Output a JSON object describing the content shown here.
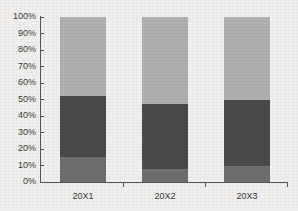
{
  "chart_data": {
    "type": "bar",
    "stacked": true,
    "title": "",
    "subtitle": "",
    "xlabel": "",
    "ylabel": "",
    "grid": false,
    "legend": "none",
    "categories": [
      "20X1",
      "20X2",
      "20X3"
    ],
    "ylim": [
      0,
      100
    ],
    "y_tick_labels": [
      "100%",
      "90%",
      "80%",
      "70%",
      "60%",
      "50%",
      "40%",
      "30%",
      "20%",
      "10%",
      "0%"
    ],
    "y_tick_values": [
      100,
      90,
      80,
      70,
      60,
      50,
      40,
      30,
      20,
      10,
      0
    ],
    "series": [
      {
        "name": "bottom-segment",
        "color": "#6e6e6e",
        "values": [
          15,
          8,
          10
        ]
      },
      {
        "name": "middle-segment",
        "color": "#4a4a4a",
        "values": [
          37,
          39,
          40
        ]
      },
      {
        "name": "top-segment",
        "color": "#b0b0b0",
        "values": [
          48,
          53,
          50
        ]
      }
    ],
    "cumulative_tops": [
      {
        "category": "20X1",
        "bottom_top": 15,
        "middle_top": 52,
        "total": 100
      },
      {
        "category": "20X2",
        "bottom_top": 8,
        "middle_top": 47,
        "total": 100
      },
      {
        "category": "20X3",
        "bottom_top": 10,
        "middle_top": 50,
        "total": 100
      }
    ]
  },
  "axes": {
    "value_axis_name": "percent-axis",
    "category_axis_name": "period-axis"
  },
  "colors": {
    "background": "#f1f0ee",
    "axis": "#555452",
    "text": "#3b3a39",
    "series_light": "#b0b0b0",
    "series_dark": "#4a4a4a",
    "series_medium": "#6e6e6e"
  }
}
